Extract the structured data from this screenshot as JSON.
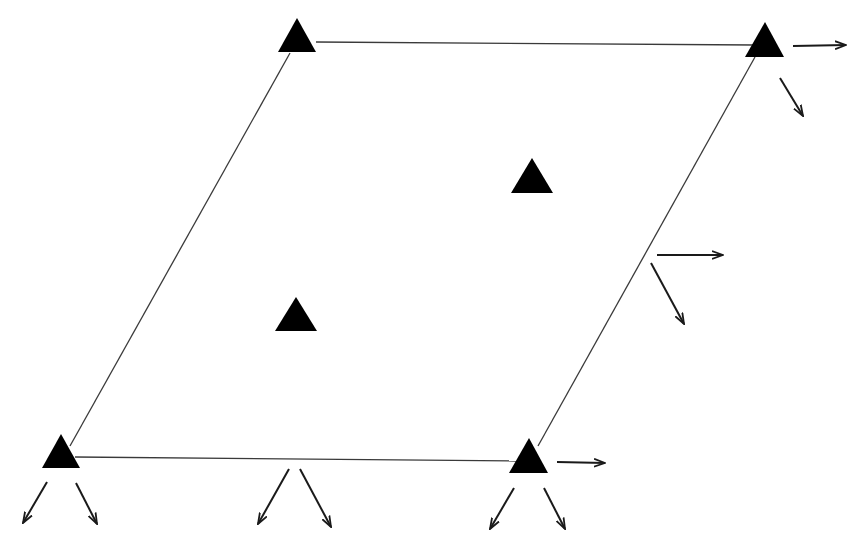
{
  "diagram": {
    "type": "parallelogram-with-supports",
    "colors": {
      "background": "#ffffff",
      "stroke": "#3a3a3a",
      "fill": "#000000",
      "arrow": "#1a1a1a"
    },
    "edges": [
      {
        "name": "top-edge",
        "x1": 316,
        "y1": 42,
        "x2": 755,
        "y2": 45
      },
      {
        "name": "left-edge",
        "x1": 290,
        "y1": 53,
        "x2": 70,
        "y2": 446
      },
      {
        "name": "right-edge",
        "x1": 755,
        "y1": 57,
        "x2": 538,
        "y2": 446
      },
      {
        "name": "bottom-edge",
        "x1": 75,
        "y1": 457,
        "x2": 517,
        "y2": 461
      }
    ],
    "triangles": [
      {
        "name": "triangle-top-left",
        "points": "297,18 278,52 316,52"
      },
      {
        "name": "triangle-top-right",
        "points": "765,22 745,57 784,57"
      },
      {
        "name": "triangle-interior-upper",
        "points": "532,158 511,193 553,193"
      },
      {
        "name": "triangle-interior-lower",
        "points": "296,297 275,331 317,331"
      },
      {
        "name": "triangle-bottom-left",
        "points": "61,434 42,468 80,468"
      },
      {
        "name": "triangle-bottom-right",
        "points": "529,438 509,473 548,473"
      }
    ],
    "arrows": [
      {
        "name": "arrow-top-right-horizontal",
        "x1": 793,
        "y1": 46,
        "x2": 846,
        "y2": 45
      },
      {
        "name": "arrow-top-right-diagonal",
        "x1": 780,
        "y1": 78,
        "x2": 803,
        "y2": 116
      },
      {
        "name": "arrow-mid-right-horizontal",
        "x1": 657,
        "y1": 255,
        "x2": 723,
        "y2": 255
      },
      {
        "name": "arrow-mid-right-diagonal",
        "x1": 651,
        "y1": 263,
        "x2": 684,
        "y2": 324
      },
      {
        "name": "arrow-bottom-right-horizontal",
        "x1": 557,
        "y1": 462,
        "x2": 605,
        "y2": 463
      },
      {
        "name": "arrow-bottom-left-left",
        "x1": 47,
        "y1": 482,
        "x2": 23,
        "y2": 523
      },
      {
        "name": "arrow-bottom-left-right",
        "x1": 76,
        "y1": 483,
        "x2": 97,
        "y2": 524
      },
      {
        "name": "arrow-bottom-mid-left",
        "x1": 289,
        "y1": 469,
        "x2": 258,
        "y2": 524
      },
      {
        "name": "arrow-bottom-mid-right",
        "x1": 300,
        "y1": 469,
        "x2": 331,
        "y2": 527
      },
      {
        "name": "arrow-bottom-right-left",
        "x1": 514,
        "y1": 488,
        "x2": 490,
        "y2": 529
      },
      {
        "name": "arrow-bottom-right-right",
        "x1": 544,
        "y1": 488,
        "x2": 565,
        "y2": 529
      }
    ]
  }
}
